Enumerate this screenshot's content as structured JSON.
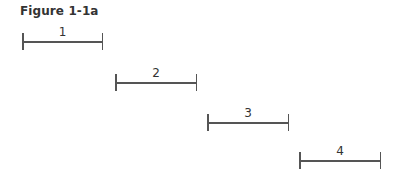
{
  "figure": {
    "title": "Figure 1-1a",
    "segments": [
      {
        "label": "1",
        "x1": 22,
        "x2": 103,
        "y": 41
      },
      {
        "label": "2",
        "x1": 115,
        "x2": 197,
        "y": 82
      },
      {
        "label": "3",
        "x1": 207,
        "x2": 289,
        "y": 122
      },
      {
        "label": "4",
        "x1": 299,
        "x2": 381,
        "y": 160
      }
    ],
    "line_color": "#555555"
  }
}
